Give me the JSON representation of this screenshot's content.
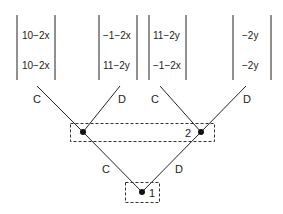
{
  "diagram": {
    "type": "extensive-form game tree",
    "colors": {
      "line": "#222222",
      "node": "#111111",
      "dash": "#333333"
    },
    "payoffs": [
      {
        "top": "10−2x",
        "bottom": "10−2x"
      },
      {
        "top": "−1−2x",
        "bottom": "11−2y"
      },
      {
        "top": "11−2y",
        "bottom": "−1−2x"
      },
      {
        "top": "−2y",
        "bottom": "−2y"
      }
    ],
    "root": {
      "info_set_label": "1",
      "branches": [
        {
          "label": "C"
        },
        {
          "label": "D"
        }
      ]
    },
    "second_stage": {
      "info_set_label": "2",
      "left_node_branches": [
        {
          "label": "C"
        },
        {
          "label": "D"
        }
      ],
      "right_node_branches": [
        {
          "label": "C"
        },
        {
          "label": "D"
        }
      ]
    }
  }
}
